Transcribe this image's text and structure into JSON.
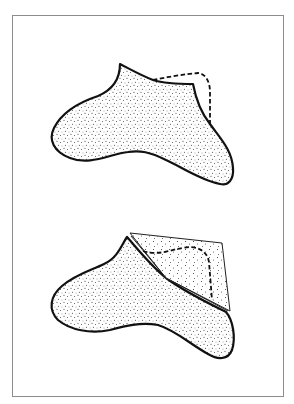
{
  "figure": {
    "background_color": "#ffffff",
    "frame_color": "#8c8c8c",
    "ink_color": "#111111",
    "panels": [
      {
        "id": "top",
        "description": "Stippled foot-shaped piece with a dashed outline indicating the original extended edge",
        "elements": [
          "stippled-shape",
          "dashed-outline"
        ]
      },
      {
        "id": "bottom",
        "description": "Same stippled shape with a triangular flap folded over, dashed line showing the edge beneath",
        "elements": [
          "stippled-shape",
          "folded-triangle-flap",
          "fold-line",
          "dashed-outline"
        ]
      }
    ]
  }
}
